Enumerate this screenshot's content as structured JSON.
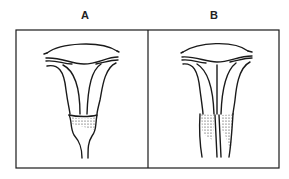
{
  "panels": [
    {
      "label": "A",
      "description": "uterus with single cervix"
    },
    {
      "label": "B",
      "description": "uterus with septate cervix"
    }
  ],
  "colors": {
    "ink": "#1a1a1a",
    "background": "#ffffff"
  }
}
